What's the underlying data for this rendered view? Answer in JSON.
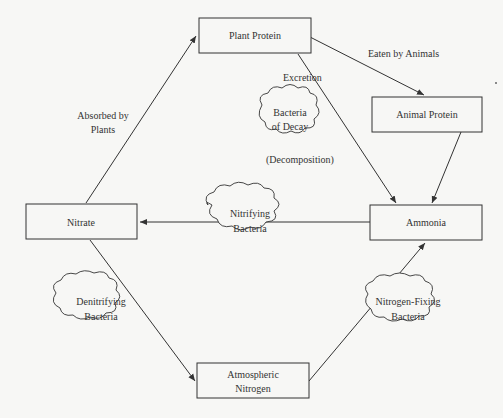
{
  "diagram": {
    "colors": {
      "background": "#f7f7f5",
      "ink": "#333333"
    },
    "nodes": [
      {
        "id": "plant_protein",
        "label": "Plant Protein"
      },
      {
        "id": "animal_protein",
        "label": "Animal Protein"
      },
      {
        "id": "ammonia",
        "label": "Ammonia"
      },
      {
        "id": "nitrate",
        "label": "Nitrate"
      },
      {
        "id": "atmospheric_nitrogen",
        "line1": "Atmospheric",
        "line2": "Nitrogen"
      }
    ],
    "clouds": [
      {
        "id": "bacteria_of_decay",
        "line1": "Bacteria",
        "line2": "of Decay"
      },
      {
        "id": "nitrifying_bacteria",
        "line1": "Nitrifying",
        "line2": "Bacteria"
      },
      {
        "id": "denitrifying_bacteria",
        "line1": "Denitrifying",
        "line2": "Bacteria"
      },
      {
        "id": "nitrogen_fixing_bacteria",
        "line1": "Nitrogen-Fixing",
        "line2": "Bacteria"
      }
    ],
    "edge_labels": {
      "eaten_by_animals": "Eaten by Animals",
      "excretion": "Excretion",
      "decomposition": "(Decomposition)",
      "absorbed_line1": "Absorbed by",
      "absorbed_line2": "Plants"
    },
    "edges": [
      {
        "from": "plant_protein",
        "to": "animal_protein",
        "label": "Eaten by Animals"
      },
      {
        "from": "plant_protein",
        "to": "ammonia",
        "label": "Excretion"
      },
      {
        "from": "animal_protein",
        "to": "ammonia"
      },
      {
        "from": "ammonia",
        "to": "nitrate",
        "via": "Nitrifying Bacteria"
      },
      {
        "from": "nitrate",
        "to": "plant_protein",
        "label": "Absorbed by Plants"
      },
      {
        "from": "nitrate",
        "to": "atmospheric_nitrogen",
        "via": "Denitrifying Bacteria"
      },
      {
        "from": "atmospheric_nitrogen",
        "to": "ammonia",
        "via": "Nitrogen-Fixing Bacteria"
      }
    ]
  }
}
